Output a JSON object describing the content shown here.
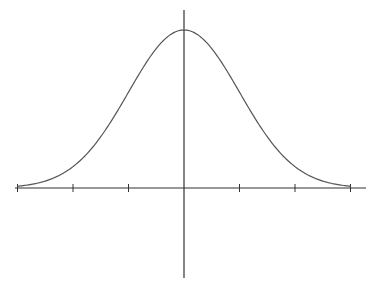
{
  "chart_data": {
    "type": "line",
    "title": "",
    "xlabel": "",
    "ylabel": "",
    "x_ticks": [
      -3,
      -2,
      -1,
      0,
      1,
      2,
      3
    ],
    "x_tick_labels": [],
    "xlim": [
      -3.15,
      3.35
    ],
    "ylim": [
      -0.35,
      0.45
    ],
    "grid": false,
    "legend": null,
    "series": [
      {
        "name": "normal-pdf",
        "mean": 0,
        "std": 1,
        "x": [
          -3,
          -2.5,
          -2,
          -1.5,
          -1,
          -0.5,
          0,
          0.5,
          1,
          1.5,
          2,
          2.5,
          3
        ],
        "y": [
          0.0044,
          0.0175,
          0.054,
          0.1295,
          0.242,
          0.3521,
          0.3989,
          0.3521,
          0.242,
          0.1295,
          0.054,
          0.0175,
          0.0044
        ]
      }
    ],
    "colors": {
      "curve": "#555555",
      "axes": "#333333",
      "background": "#ffffff"
    }
  },
  "layout": {
    "origin_x": 184,
    "baseline_y": 188,
    "peak_y": 30,
    "px_per_unit_x": 55.5,
    "x_axis": {
      "x1": 15,
      "x2": 366
    },
    "y_axis": {
      "y1": 10,
      "y2": 278
    },
    "tick_half_len": 4
  }
}
